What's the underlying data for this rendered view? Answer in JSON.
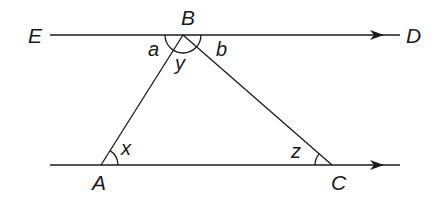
{
  "diagram": {
    "points": {
      "E": {
        "label": "E"
      },
      "B": {
        "label": "B"
      },
      "D": {
        "label": "D"
      },
      "A": {
        "label": "A"
      },
      "C": {
        "label": "C"
      }
    },
    "angles": {
      "a": "a",
      "y": "y",
      "b": "b",
      "x": "x",
      "z": "z"
    },
    "colors": {
      "stroke": "#1a1a1a",
      "background": "#ffffff"
    }
  }
}
